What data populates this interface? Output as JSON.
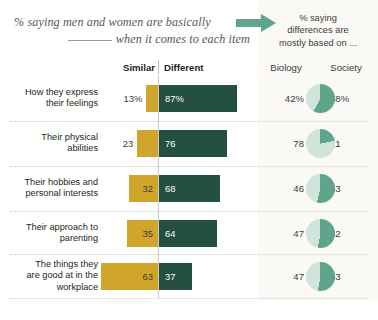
{
  "title": {
    "line1": "% saying men and women are basically",
    "line2": "when it comes to each item"
  },
  "right_panel": {
    "heading_line1": "% saying",
    "heading_line2": "differences are",
    "heading_line3": "mostly based on ...",
    "biology_label": "Biology",
    "society_label": "Society"
  },
  "columns": {
    "similar": "Similar",
    "different": "Different"
  },
  "colors": {
    "similar": "#cfa52c",
    "different": "#23503f",
    "biology_slice": "#cfe5dc",
    "society_slice": "#5ea58c",
    "arrow": "#5ea58c",
    "panel_bg": "#faf9f5"
  },
  "chart_data": {
    "type": "bar",
    "categories": [
      "How they express their feelings",
      "Their physical abilities",
      "Their hobbies and personal interests",
      "Their approach to parenting",
      "The things they are good at in the workplace"
    ],
    "series": [
      {
        "name": "Similar",
        "values": [
          13,
          23,
          32,
          35,
          63
        ]
      },
      {
        "name": "Different",
        "values": [
          87,
          76,
          68,
          64,
          37
        ]
      }
    ],
    "pies": {
      "title": "% saying differences are mostly based on ...",
      "type": "pie",
      "labels": [
        "Biology",
        "Society"
      ],
      "values": [
        [
          42,
          58
        ],
        [
          78,
          21
        ],
        [
          46,
          53
        ],
        [
          47,
          52
        ],
        [
          47,
          53
        ]
      ]
    },
    "xlabel": "",
    "ylabel": "",
    "grid": false,
    "legend": "top"
  },
  "rows": [
    {
      "label_lines": [
        "How they express",
        "their feelings"
      ],
      "similar": "13%",
      "different": "87%",
      "biology": "42%",
      "society": "58%",
      "similar_value": 13,
      "different_value": 87,
      "biology_value": 42
    },
    {
      "label_lines": [
        "Their physical",
        "abilities"
      ],
      "similar": "23",
      "different": "76",
      "biology": "78",
      "society": "21",
      "similar_value": 23,
      "different_value": 76,
      "biology_value": 78
    },
    {
      "label_lines": [
        "Their hobbies and",
        "personal interests"
      ],
      "similar": "32",
      "different": "68",
      "biology": "46",
      "society": "53",
      "similar_value": 32,
      "different_value": 68,
      "biology_value": 46
    },
    {
      "label_lines": [
        "Their approach to",
        "parenting"
      ],
      "similar": "35",
      "different": "64",
      "biology": "47",
      "society": "52",
      "similar_value": 35,
      "different_value": 64,
      "biology_value": 47
    },
    {
      "label_lines": [
        "The things they",
        "are good at in the",
        "workplace"
      ],
      "similar": "63",
      "different": "37",
      "biology": "47",
      "society": "53",
      "similar_value": 63,
      "different_value": 37,
      "biology_value": 47
    }
  ]
}
